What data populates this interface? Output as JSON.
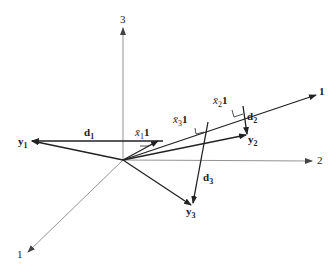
{
  "diagram": {
    "axes": [
      {
        "name": "axis-1",
        "label": "1"
      },
      {
        "name": "axis-2",
        "label": "2"
      },
      {
        "name": "axis-3",
        "label": "3"
      }
    ],
    "vectors": {
      "one": {
        "label": "1"
      },
      "y1": {
        "label": "y",
        "sub": "1"
      },
      "y2": {
        "label": "y",
        "sub": "2"
      },
      "y3": {
        "label": "y",
        "sub": "3"
      },
      "d1": {
        "label": "d",
        "sub": "1"
      },
      "d2": {
        "label": "d",
        "sub": "2"
      },
      "d3": {
        "label": "d",
        "sub": "3"
      },
      "x1": {
        "label": "x̄",
        "sub": "1",
        "suffix": "1"
      },
      "x2": {
        "label": "x̄",
        "sub": "2",
        "suffix": "1"
      },
      "x3": {
        "label": "x̄",
        "sub": "3",
        "suffix": "1"
      }
    }
  }
}
